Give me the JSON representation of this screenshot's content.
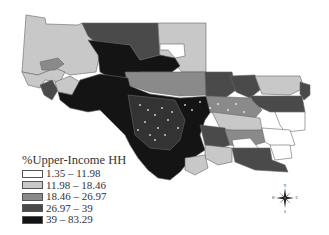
{
  "legend": {
    "title": "%Upper-Income HH",
    "classes": [
      {
        "label": "1.35 – 11.98",
        "color": "#ffffff"
      },
      {
        "label": "11.98 – 18.46",
        "color": "#c8c8c8"
      },
      {
        "label": "18.46 – 26.97",
        "color": "#8a8a8a"
      },
      {
        "label": "26.97 – 39",
        "color": "#4a4a4a"
      },
      {
        "label": "39 – 83.29",
        "color": "#141414"
      }
    ]
  },
  "compass": {
    "n": "N",
    "s": "S",
    "e": "E",
    "w": "W"
  }
}
